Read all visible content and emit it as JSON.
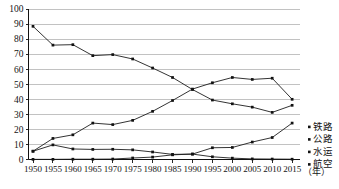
{
  "chart_data": {
    "type": "line",
    "title": "",
    "subtitle": "",
    "xlabel": "年",
    "ylabel": "",
    "xlim": [
      1950,
      2015
    ],
    "ylim": [
      0,
      100
    ],
    "grid": true,
    "legend_position": "right",
    "categories": [
      1950,
      1955,
      1960,
      1965,
      1970,
      1975,
      1980,
      1985,
      1990,
      1995,
      2000,
      2005,
      2010,
      2015
    ],
    "x_tick_labels": [
      "1950",
      "1955",
      "1960",
      "1965",
      "1970",
      "1975",
      "1980",
      "1985",
      "1990",
      "1995",
      "2000",
      "2005",
      "2010",
      "2015"
    ],
    "y_tick_labels": [
      "0",
      "10",
      "20",
      "30",
      "40",
      "50",
      "60",
      "70",
      "80",
      "90",
      "100"
    ],
    "y_ticks": [
      0,
      10,
      20,
      30,
      40,
      50,
      60,
      70,
      80,
      90,
      100
    ],
    "series": [
      {
        "name": "铁路",
        "values": [
          88.5,
          76.0,
          76.3,
          69.0,
          69.7,
          66.8,
          60.8,
          54.5,
          46.5,
          39.5,
          37.0,
          34.8,
          31.3,
          36.0
        ]
      },
      {
        "name": "公路",
        "values": [
          5.5,
          14.0,
          16.4,
          24.2,
          23.2,
          26.0,
          32.0,
          39.2,
          46.8,
          51.0,
          54.5,
          53.2,
          54.0,
          40.0
        ]
      },
      {
        "name": "水运",
        "values": [
          5.5,
          9.7,
          7.0,
          6.7,
          6.8,
          6.4,
          5.0,
          3.4,
          3.6,
          1.8,
          0.9,
          0.4,
          0.3,
          0.2
        ]
      },
      {
        "name": "航空",
        "values": [
          0.1,
          0.1,
          0.2,
          0.2,
          0.3,
          1.0,
          1.6,
          3.1,
          3.6,
          7.8,
          8.0,
          11.6,
          14.6,
          24.2
        ]
      }
    ],
    "colors": {
      "line": "#1d1d1d",
      "grid": "#9a9a9a",
      "axis": "#111111",
      "text": "#141414"
    }
  },
  "legend": {
    "items": [
      {
        "label": "铁路"
      },
      {
        "label": "公路"
      },
      {
        "label": "水运"
      },
      {
        "label": "航空"
      }
    ]
  },
  "axis": {
    "x_unit": "（年）"
  }
}
